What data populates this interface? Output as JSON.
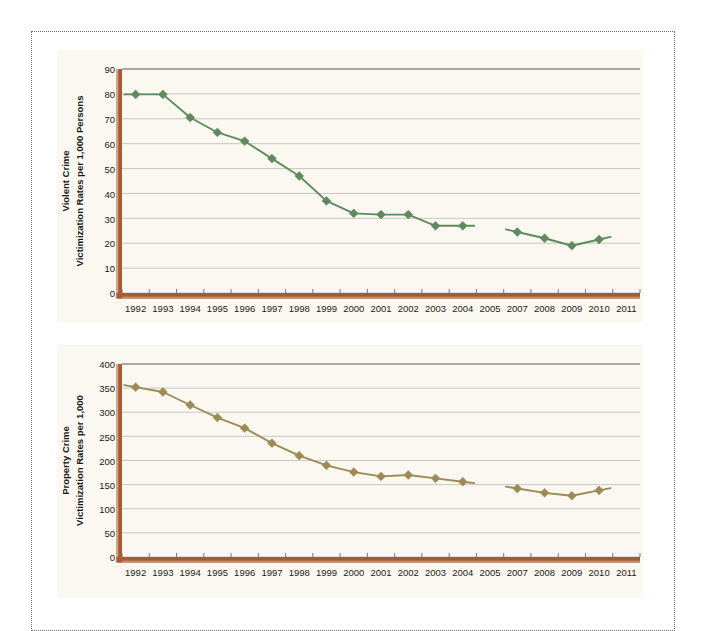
{
  "page": {
    "background_color": "#ffffff",
    "panel_background_color": "#faf8f1",
    "frame_border_color": "#6f6f6f"
  },
  "chart_data": [
    {
      "id": "violent-crime",
      "type": "line",
      "title": "",
      "ylabel_line1": "Violent Crime",
      "ylabel_line2": "Victimization Rates per 1,000 Persons",
      "xlabel": "",
      "grid": true,
      "legend_position": "none",
      "series_color": "#5f8a5f",
      "axis_color": "#a55b36",
      "marker": "diamond",
      "ylim": [
        0,
        90
      ],
      "yticks": [
        0,
        10,
        20,
        30,
        40,
        50,
        60,
        70,
        80,
        90
      ],
      "ytick_labels": [
        "0",
        "10",
        "20",
        "30",
        "40",
        "50",
        "60",
        "70",
        "80",
        "90"
      ],
      "categories": [
        "1992",
        "1993",
        "1994",
        "1995",
        "1996",
        "1997",
        "1998",
        "1999",
        "2000",
        "2001",
        "2002",
        "2003",
        "2004",
        "2005",
        "2007",
        "2008",
        "2009",
        "2010",
        "2011"
      ],
      "xtick_labels": [
        "1992",
        "1993",
        "1994",
        "1995",
        "1996",
        "1997",
        "1998",
        "1999",
        "2000",
        "2001",
        "2002",
        "2003",
        "2004",
        "2005",
        "2007",
        "2008",
        "2009",
        "2010",
        "2011"
      ],
      "values": [
        79.8,
        79.8,
        70.5,
        64.5,
        61.0,
        54.0,
        47.0,
        37.0,
        32.0,
        31.5,
        31.5,
        27.0,
        27.0,
        null,
        24.5,
        22.0,
        19.0,
        21.5,
        null
      ],
      "break_after_category": "2005",
      "note": "series interrupted between 2005 and 2007 (no 2006 data shown)"
    },
    {
      "id": "property-crime",
      "type": "line",
      "title": "",
      "ylabel_line1": "Property Crime",
      "ylabel_line2": "Victimization Rates per 1,000",
      "xlabel": "",
      "grid": true,
      "legend_position": "none",
      "series_color": "#9d8a55",
      "axis_color": "#a55b36",
      "marker": "diamond",
      "ylim": [
        0,
        400
      ],
      "yticks": [
        0,
        50,
        100,
        150,
        200,
        250,
        300,
        350,
        400
      ],
      "ytick_labels": [
        "0",
        "50",
        "100",
        "150",
        "200",
        "250",
        "300",
        "350",
        "400"
      ],
      "categories": [
        "1992",
        "1993",
        "1994",
        "1995",
        "1996",
        "1997",
        "1998",
        "1999",
        "2000",
        "2001",
        "2002",
        "2003",
        "2004",
        "2005",
        "2007",
        "2008",
        "2009",
        "2010",
        "2011"
      ],
      "xtick_labels": [
        "1992",
        "1993",
        "1994",
        "1995",
        "1996",
        "1997",
        "1998",
        "1999",
        "2000",
        "2001",
        "2002",
        "2003",
        "2004",
        "2005",
        "2007",
        "2008",
        "2009",
        "2010",
        "2011"
      ],
      "values": [
        352,
        342,
        315,
        289,
        267,
        236,
        210,
        190,
        176,
        167,
        170,
        163,
        156,
        null,
        142,
        133,
        127,
        138,
        null
      ],
      "break_after_category": "2005",
      "note": "series interrupted between 2005 and 2007 (no 2006 data shown)"
    }
  ]
}
